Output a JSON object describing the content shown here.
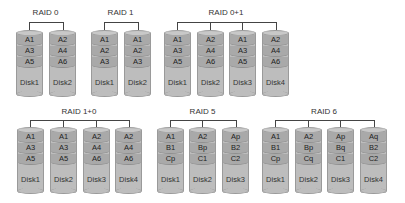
{
  "diagram_title": "RAID levels",
  "groups": [
    {
      "name": "RAID 0",
      "disks": [
        {
          "label": "Disk1",
          "blocks": [
            "A1",
            "A3",
            "A5"
          ]
        },
        {
          "label": "Disk2",
          "blocks": [
            "A2",
            "A4",
            "A6"
          ]
        }
      ]
    },
    {
      "name": "RAID 1",
      "disks": [
        {
          "label": "Disk1",
          "blocks": [
            "A1",
            "A2",
            "A3"
          ]
        },
        {
          "label": "Disk2",
          "blocks": [
            "A1",
            "A2",
            "A3"
          ]
        }
      ]
    },
    {
      "name": "RAID 0+1",
      "disks": [
        {
          "label": "Disk1",
          "blocks": [
            "A1",
            "A3",
            "A5"
          ]
        },
        {
          "label": "Disk2",
          "blocks": [
            "A2",
            "A4",
            "A6"
          ]
        },
        {
          "label": "Disk3",
          "blocks": [
            "A1",
            "A3",
            "A5"
          ]
        },
        {
          "label": "Disk4",
          "blocks": [
            "A2",
            "A4",
            "A6"
          ]
        }
      ]
    },
    {
      "name": "RAID 1+0",
      "disks": [
        {
          "label": "Disk1",
          "blocks": [
            "A1",
            "A3",
            "A5"
          ]
        },
        {
          "label": "Disk2",
          "blocks": [
            "A1",
            "A3",
            "A5"
          ]
        },
        {
          "label": "Disk3",
          "blocks": [
            "A2",
            "A4",
            "A6"
          ]
        },
        {
          "label": "Disk4",
          "blocks": [
            "A2",
            "A4",
            "A6"
          ]
        }
      ]
    },
    {
      "name": "RAID 5",
      "disks": [
        {
          "label": "Disk1",
          "blocks": [
            "A1",
            "B1",
            "Cp"
          ]
        },
        {
          "label": "Disk2",
          "blocks": [
            "A2",
            "Bp",
            "C1"
          ]
        },
        {
          "label": "Disk3",
          "blocks": [
            "Ap",
            "B2",
            "C2"
          ]
        }
      ]
    },
    {
      "name": "RAID 6",
      "disks": [
        {
          "label": "Disk1",
          "blocks": [
            "A1",
            "B1",
            "Cp"
          ]
        },
        {
          "label": "Disk2",
          "blocks": [
            "A2",
            "Bp",
            "Cq"
          ]
        },
        {
          "label": "Disk3",
          "blocks": [
            "Ap",
            "Bq",
            "C1"
          ]
        },
        {
          "label": "Disk4",
          "blocks": [
            "Aq",
            "B2",
            "C2"
          ]
        }
      ]
    }
  ],
  "colors": {
    "disk_body": "#bdbdbd",
    "stripe": "#a9a9a9",
    "line": "#444444"
  }
}
